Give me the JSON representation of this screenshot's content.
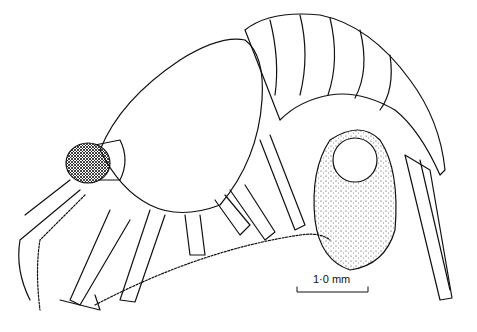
{
  "figure": {
    "scale_bar": {
      "label": "1·0 mm"
    }
  }
}
